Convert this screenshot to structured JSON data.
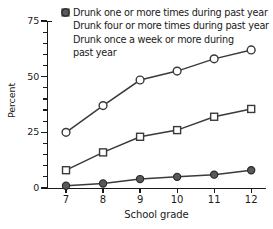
{
  "chart_data": {
    "type": "line",
    "title": "",
    "xlabel": "School grade",
    "ylabel": "Percent",
    "categories": [
      "7",
      "8",
      "9",
      "10",
      "11",
      "12"
    ],
    "x": [
      7,
      8,
      9,
      10,
      11,
      12
    ],
    "xlim": [
      6.5,
      12.4
    ],
    "ylim": [
      0,
      75
    ],
    "yticks": [
      0,
      25,
      50,
      75
    ],
    "yticks_minor_step": 5,
    "grid": false,
    "legend_position": "top-left inside plot",
    "series": [
      {
        "name": "Drunk one or more times during past year",
        "marker": "open-circle",
        "values": [
          25,
          37,
          48.5,
          52.5,
          58,
          62
        ]
      },
      {
        "name": "Drunk four or more times during past year",
        "marker": "open-square",
        "values": [
          8,
          16,
          23,
          26,
          32,
          35.5
        ]
      },
      {
        "name": "Drunk once a week or more during past year",
        "marker": "filled-circle",
        "values": [
          1,
          2,
          4,
          5,
          6,
          8
        ]
      }
    ]
  },
  "axes": {
    "y_title": "Percent",
    "x_title": "School grade",
    "y_tick_labels": [
      "0",
      "25",
      "50",
      "75"
    ],
    "x_tick_labels": [
      "7",
      "8",
      "9",
      "10",
      "11",
      "12"
    ]
  },
  "legend": {
    "items": [
      {
        "marker": "open-circle-icon",
        "label": "Drunk one or more times during past year",
        "label_line2": ""
      },
      {
        "marker": "open-square-icon",
        "label": "Drunk four or more times during past year",
        "label_line2": ""
      },
      {
        "marker": "filled-circle-icon",
        "label": "Drunk once a week or more during",
        "label_line2": "past year"
      }
    ]
  }
}
